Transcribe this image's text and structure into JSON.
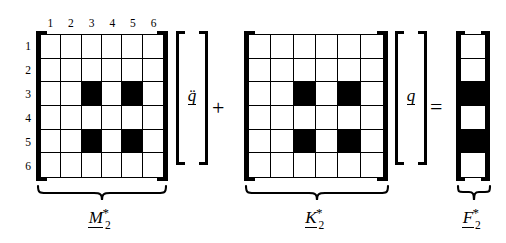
{
  "figure": {
    "type": "matrix-equation-diagram",
    "background_color": "#ffffff",
    "ink_color": "#000000",
    "filled_cell_color": "#000000",
    "empty_cell_color": "#ffffff"
  },
  "indices": {
    "column_headers": [
      "1",
      "2",
      "3",
      "4",
      "5",
      "6"
    ],
    "row_headers": [
      "1",
      "2",
      "3",
      "4",
      "5",
      "6"
    ]
  },
  "operators": {
    "plus": "+",
    "equals": "="
  },
  "terms": [
    {
      "id": "mass-matrix",
      "kind": "matrix",
      "rows": 6,
      "cols": 6,
      "show_headers": true,
      "label": {
        "base": "M",
        "superscript": "*",
        "subscript": "2",
        "underlined": true
      },
      "filled_cells": [
        [
          3,
          3
        ],
        [
          3,
          5
        ],
        [
          5,
          3
        ],
        [
          5,
          5
        ]
      ],
      "pattern": [
        [
          0,
          0,
          0,
          0,
          0,
          0
        ],
        [
          0,
          0,
          0,
          0,
          0,
          0
        ],
        [
          0,
          0,
          1,
          0,
          1,
          0
        ],
        [
          0,
          0,
          0,
          0,
          0,
          0
        ],
        [
          0,
          0,
          1,
          0,
          1,
          0
        ],
        [
          0,
          0,
          0,
          0,
          0,
          0
        ]
      ]
    },
    {
      "id": "acceleration-vector",
      "kind": "vector",
      "label": {
        "base": "q",
        "accent": "double-dot",
        "glyph": "q̈",
        "underlined": true
      }
    },
    {
      "id": "stiffness-matrix",
      "kind": "matrix",
      "rows": 6,
      "cols": 6,
      "show_headers": false,
      "label": {
        "base": "K",
        "superscript": "*",
        "subscript": "2",
        "underlined": true
      },
      "filled_cells": [
        [
          3,
          3
        ],
        [
          3,
          5
        ],
        [
          5,
          3
        ],
        [
          5,
          5
        ]
      ],
      "pattern": [
        [
          0,
          0,
          0,
          0,
          0,
          0
        ],
        [
          0,
          0,
          0,
          0,
          0,
          0
        ],
        [
          0,
          0,
          1,
          0,
          1,
          0
        ],
        [
          0,
          0,
          0,
          0,
          0,
          0
        ],
        [
          0,
          0,
          1,
          0,
          1,
          0
        ],
        [
          0,
          0,
          0,
          0,
          0,
          0
        ]
      ]
    },
    {
      "id": "displacement-vector",
      "kind": "vector",
      "label": {
        "base": "q",
        "accent": "none",
        "glyph": "q",
        "underlined": true
      }
    },
    {
      "id": "force-vector",
      "kind": "column",
      "rows": 6,
      "cols": 1,
      "label": {
        "base": "F",
        "superscript": "*",
        "subscript": "2",
        "underlined": true
      },
      "filled_cells": [
        [
          3,
          1
        ],
        [
          5,
          1
        ]
      ],
      "pattern": [
        [
          0
        ],
        [
          0
        ],
        [
          1
        ],
        [
          0
        ],
        [
          1
        ],
        [
          0
        ]
      ]
    }
  ]
}
